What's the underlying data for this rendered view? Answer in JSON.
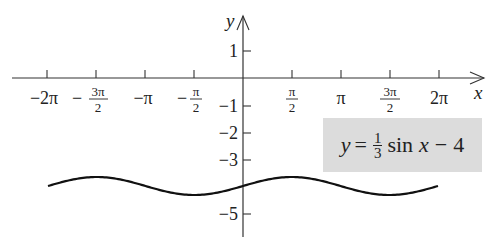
{
  "chart_data": {
    "type": "line",
    "title": "",
    "xlabel": "x",
    "ylabel": "y",
    "function": "y = (1/3) sin x - 4",
    "xlim": [
      -6.2832,
      6.2832
    ],
    "ylim": [
      -5.5,
      2
    ],
    "x_ticks": [
      "-2π",
      "-3π/2",
      "-π",
      "-π/2",
      "π/2",
      "π",
      "3π/2",
      "2π"
    ],
    "x_tick_values": [
      -6.2832,
      -4.7124,
      -3.1416,
      -1.5708,
      1.5708,
      3.1416,
      4.7124,
      6.2832
    ],
    "y_ticks": [
      "1",
      "-1",
      "-2",
      "-3",
      "-5"
    ],
    "y_tick_values": [
      1,
      -1,
      -2,
      -3,
      -5
    ],
    "series": [
      {
        "name": "y = 1/3 sin x - 4",
        "x": [
          -6.2832,
          -4.7124,
          -3.1416,
          -1.5708,
          0,
          1.5708,
          3.1416,
          4.7124,
          6.2832
        ],
        "values": [
          -4,
          -3.667,
          -4,
          -4.333,
          -4,
          -3.667,
          -4,
          -4.333,
          -4
        ]
      }
    ],
    "annotation": "y = 1/3 sin x − 4",
    "grid": false,
    "legend": "none"
  },
  "axes": {
    "x_label": "x",
    "y_label": "y"
  },
  "ticks": {
    "x": [
      {
        "sign": "−",
        "main": "2π",
        "frac": false
      },
      {
        "sign": "−",
        "num": "3π",
        "den": "2",
        "frac": true
      },
      {
        "sign": "−",
        "main": "π",
        "frac": false
      },
      {
        "sign": "−",
        "num": "π",
        "den": "2",
        "frac": true
      },
      {
        "sign": "",
        "num": "π",
        "den": "2",
        "frac": true
      },
      {
        "sign": "",
        "main": "π",
        "frac": false
      },
      {
        "sign": "",
        "num": "3π",
        "den": "2",
        "frac": true
      },
      {
        "sign": "",
        "main": "2π",
        "frac": false
      }
    ],
    "y": [
      "1",
      "−1",
      "−2",
      "−3",
      "−5"
    ]
  },
  "equation": {
    "lhs": "y",
    "equals": "=",
    "frac_num": "1",
    "frac_den": "3",
    "func": "sin",
    "arg": "x",
    "op": "−",
    "const": "4"
  },
  "colors": {
    "axis": "#333333",
    "curve": "#111111",
    "box": "#dcdcdc"
  }
}
